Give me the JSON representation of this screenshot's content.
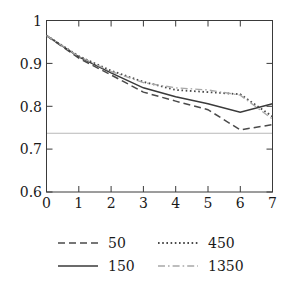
{
  "chart_data": {
    "type": "line",
    "title": "",
    "xlabel": "",
    "ylabel": "",
    "xlim": [
      0,
      7
    ],
    "ylim": [
      0.6,
      1.0
    ],
    "grid": false,
    "legend_position": "bottom",
    "x_ticks": [
      "0",
      "1",
      "2",
      "3",
      "4",
      "5",
      "6",
      "7"
    ],
    "y_ticks": [
      "0.6",
      "0.7",
      "0.8",
      "0.9",
      "1"
    ],
    "x": [
      0,
      1,
      2,
      3,
      4,
      5,
      6,
      7
    ],
    "annotations": [
      {
        "name": "horizontal-reference-line",
        "type": "hline",
        "y": 0.737
      }
    ],
    "series": [
      {
        "name": "50",
        "style": "dashed",
        "color": "#4a4a4a",
        "values": [
          0.965,
          0.912,
          0.873,
          0.833,
          0.812,
          0.792,
          0.745,
          0.757
        ]
      },
      {
        "name": "150",
        "style": "solid",
        "color": "#3a3a3a",
        "values": [
          0.965,
          0.915,
          0.878,
          0.843,
          0.822,
          0.806,
          0.786,
          0.806
        ]
      },
      {
        "name": "450",
        "style": "dotted",
        "color": "#4a4a4a",
        "values": [
          0.965,
          0.917,
          0.883,
          0.857,
          0.838,
          0.833,
          0.828,
          0.776
        ]
      },
      {
        "name": "1350",
        "style": "dashdot",
        "color": "#a8a8a8",
        "values": [
          0.965,
          0.916,
          0.881,
          0.855,
          0.843,
          0.838,
          0.826,
          0.77
        ]
      }
    ]
  },
  "legend": {
    "entries": [
      {
        "label": "50",
        "style": "dashed",
        "color": "#4a4a4a"
      },
      {
        "label": "150",
        "style": "solid",
        "color": "#3a3a3a"
      },
      {
        "label": "450",
        "style": "dotted",
        "color": "#4a4a4a"
      },
      {
        "label": "1350",
        "style": "dashdot",
        "color": "#a8a8a8"
      }
    ]
  }
}
